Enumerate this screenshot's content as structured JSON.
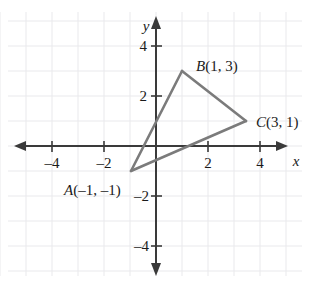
{
  "figure": {
    "type": "coordinate-plane-triangle",
    "background_color": "#ffffff",
    "grid_color": "#e9e9ec",
    "axis_color": "#3a3a3a",
    "shape_color": "#7b7b7b",
    "text_color": "#1a1a1a"
  },
  "axes": {
    "x_axis_label": "x",
    "y_axis_label": "y",
    "x_ticks": [
      {
        "value": -4,
        "label": "–4"
      },
      {
        "value": -2,
        "label": "–2"
      },
      {
        "value": 2,
        "label": "2"
      },
      {
        "value": 4,
        "label": "4"
      }
    ],
    "y_ticks": [
      {
        "value": 4,
        "label": "4"
      },
      {
        "value": 2,
        "label": "2"
      },
      {
        "value": -2,
        "label": "–2"
      },
      {
        "value": -4,
        "label": "–4"
      }
    ],
    "x_range": [
      -5.5,
      5.5
    ],
    "y_range": [
      -5.4,
      5.4
    ],
    "grid_step": 1
  },
  "triangle": {
    "vertices": [
      {
        "id": "A",
        "x": -1,
        "y": -1,
        "label_letter": "A",
        "label_coords": "(–1, –1)"
      },
      {
        "id": "B",
        "x": 1,
        "y": 3,
        "label_letter": "B",
        "label_coords": "(1, 3)"
      },
      {
        "id": "C",
        "x": 3,
        "y": 1,
        "label_letter": "C",
        "label_coords": "(3, 1)"
      }
    ],
    "edges": [
      {
        "from": "A",
        "to": "B"
      },
      {
        "from": "B",
        "to": "C"
      },
      {
        "from": "C",
        "to": "A"
      }
    ]
  }
}
